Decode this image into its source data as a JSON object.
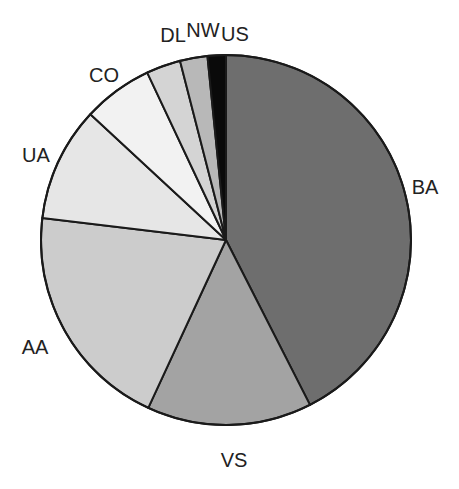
{
  "chart_data": {
    "type": "pie",
    "title": "",
    "start_angle_deg": 0,
    "direction": "clockwise",
    "center": [
      226,
      240
    ],
    "radius": 185,
    "categories": [
      "BA",
      "VS",
      "AA",
      "UA",
      "CO",
      "DL",
      "NW",
      "US"
    ],
    "values": [
      42.5,
      14.4,
      20.0,
      10.0,
      6.1,
      3.0,
      2.4,
      1.6
    ],
    "colors": [
      "#6e6e6e",
      "#a3a3a3",
      "#cccccc",
      "#e6e6e6",
      "#f2f2f2",
      "#d4d4d4",
      "#b8b8b8",
      "#0a0a0a"
    ],
    "labels": [
      {
        "text": "BA",
        "x": 425,
        "y": 187
      },
      {
        "text": "VS",
        "x": 234,
        "y": 460
      },
      {
        "text": "AA",
        "x": 35,
        "y": 347
      },
      {
        "text": "UA",
        "x": 36,
        "y": 155
      },
      {
        "text": "CO",
        "x": 104,
        "y": 75
      },
      {
        "text": "DL",
        "x": 173,
        "y": 35
      },
      {
        "text": "NW",
        "x": 203,
        "y": 30
      },
      {
        "text": "US",
        "x": 235,
        "y": 34
      }
    ],
    "legend": "none",
    "grid": false
  }
}
